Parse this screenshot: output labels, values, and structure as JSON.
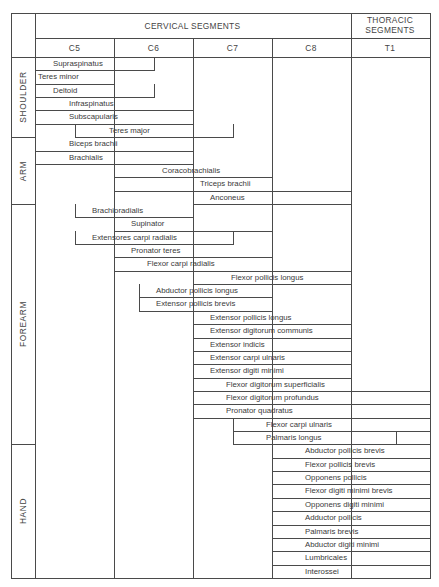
{
  "header": {
    "cervical_title": "CERVICAL SEGMENTS",
    "thoracic_title_line1": "THORACIC",
    "thoracic_title_line2": "SEGMENTS",
    "columns": [
      "C5",
      "C6",
      "C7",
      "C8",
      "T1"
    ]
  },
  "regions": [
    {
      "name": "SHOULDER",
      "start_row": 0,
      "rows": 6
    },
    {
      "name": "ARM",
      "start_row": 6,
      "rows": 5
    },
    {
      "name": "FOREARM",
      "start_row": 11,
      "rows": 18
    },
    {
      "name": "HAND",
      "start_row": 29,
      "rows": 10
    }
  ],
  "chart_data": {
    "type": "table",
    "segments": [
      "C5",
      "C6",
      "C7",
      "C8",
      "T1"
    ],
    "segment_groups": [
      {
        "label": "CERVICAL SEGMENTS",
        "segments": [
          "C5",
          "C6",
          "C7",
          "C8"
        ]
      },
      {
        "label": "THORACIC SEGMENTS",
        "segments": [
          "T1"
        ]
      }
    ],
    "note": "start/end expressed in segment units: 0 = start of C5, 1 = start of C6, 2 = start of C7, 3 = start of C8, 4 = start of T1, 5 = end of T1",
    "muscles": [
      {
        "region": "SHOULDER",
        "name": "Supraspinatus",
        "start": 0,
        "end": 1.5,
        "text_offset": 0.22
      },
      {
        "region": "SHOULDER",
        "name": "Teres minor",
        "start": 0,
        "end": 1,
        "text_offset": 0.03
      },
      {
        "region": "SHOULDER",
        "name": "Deltoid",
        "start": 0,
        "end": 1.5,
        "text_offset": 0.22
      },
      {
        "region": "SHOULDER",
        "name": "Infraspinatus",
        "start": 0,
        "end": 2,
        "text_offset": 0.42
      },
      {
        "region": "SHOULDER",
        "name": "Subscapularis",
        "start": 0,
        "end": 2,
        "text_offset": 0.42
      },
      {
        "region": "SHOULDER",
        "name": "Teres major",
        "start": 0.5,
        "end": 2.5,
        "text_offset": 0.42
      },
      {
        "region": "ARM",
        "name": "Biceps brachii",
        "start": 0,
        "end": 2,
        "text_offset": 0.42
      },
      {
        "region": "ARM",
        "name": "Brachialis",
        "start": 0,
        "end": 2,
        "text_offset": 0.42
      },
      {
        "region": "ARM",
        "name": "Coracobrachialis",
        "start": 1,
        "end": 3,
        "text_offset": 0.6
      },
      {
        "region": "ARM",
        "name": "Triceps brachii",
        "start": 1,
        "end": 4,
        "text_offset": 1.08
      },
      {
        "region": "ARM",
        "name": "Anconeus",
        "start": 2,
        "end": 4,
        "text_offset": 0.2
      },
      {
        "region": "FOREARM",
        "name": "Brachioradialis",
        "start": 0.5,
        "end": 2,
        "text_offset": 0.2
      },
      {
        "region": "FOREARM",
        "name": "Supinator",
        "start": 1,
        "end": 3,
        "text_offset": 0.2
      },
      {
        "region": "FOREARM",
        "name": "Extensores carpi radialis",
        "start": 0.5,
        "end": 2.5,
        "text_offset": 0.2
      },
      {
        "region": "FOREARM",
        "name": "Pronator teres",
        "start": 1,
        "end": 3,
        "text_offset": 0.2
      },
      {
        "region": "FOREARM",
        "name": "Flexor carpi radialis",
        "start": 1,
        "end": 4,
        "text_offset": 0.4
      },
      {
        "region": "FOREARM",
        "name": "Flexor pollicis longus",
        "start": 2,
        "end": 4,
        "text_offset": 0.47
      },
      {
        "region": "FOREARM",
        "name": "Abductor pollicis longus",
        "start": 1.32,
        "end": 3,
        "text_offset": 0.2
      },
      {
        "region": "FOREARM",
        "name": "Extensor pollicis brevis",
        "start": 1.32,
        "end": 3,
        "text_offset": 0.2
      },
      {
        "region": "FOREARM",
        "name": "Extensor pollicis longus",
        "start": 2,
        "end": 4,
        "text_offset": 0.2
      },
      {
        "region": "FOREARM",
        "name": "Extensor digitorum communis",
        "start": 2,
        "end": 4,
        "text_offset": 0.2
      },
      {
        "region": "FOREARM",
        "name": "Extensor indicis",
        "start": 2,
        "end": 4,
        "text_offset": 0.2
      },
      {
        "region": "FOREARM",
        "name": "Extensor carpi ulnaris",
        "start": 2,
        "end": 4,
        "text_offset": 0.2
      },
      {
        "region": "FOREARM",
        "name": "Extensor digiti minimi",
        "start": 2,
        "end": 4,
        "text_offset": 0.2
      },
      {
        "region": "FOREARM",
        "name": "Flexor digitorum superficialis",
        "start": 2,
        "end": 5,
        "text_offset": 0.4
      },
      {
        "region": "FOREARM",
        "name": "Flexor digitorum profundus",
        "start": 2,
        "end": 5,
        "text_offset": 0.4
      },
      {
        "region": "FOREARM",
        "name": "Pronator quadratus",
        "start": 2,
        "end": 5,
        "text_offset": 0.4
      },
      {
        "region": "FOREARM",
        "name": "Flexor carpi ulnaris",
        "start": 2.5,
        "end": 5,
        "text_offset": 0.4
      },
      {
        "region": "FOREARM",
        "name": "Palmaris longus",
        "start": 2.5,
        "end": 5,
        "text_offset": 0.4,
        "divider_at": 4.55
      },
      {
        "region": "HAND",
        "name": "Abductor pollicis brevis",
        "start": 3,
        "end": 5,
        "text_offset": 0.4
      },
      {
        "region": "HAND",
        "name": "Flexor pollicis brevis",
        "start": 3,
        "end": 5,
        "text_offset": 0.4
      },
      {
        "region": "HAND",
        "name": "Opponens pollicis",
        "start": 3,
        "end": 5,
        "text_offset": 0.4
      },
      {
        "region": "HAND",
        "name": "Flexor digiti minimi brevis",
        "start": 3,
        "end": 5,
        "text_offset": 0.4
      },
      {
        "region": "HAND",
        "name": "Opponens digiti minimi",
        "start": 3,
        "end": 5,
        "text_offset": 0.4
      },
      {
        "region": "HAND",
        "name": "Adductor pollicis",
        "start": 3,
        "end": 5,
        "text_offset": 0.4
      },
      {
        "region": "HAND",
        "name": "Palmaris brevis",
        "start": 3,
        "end": 5,
        "text_offset": 0.4
      },
      {
        "region": "HAND",
        "name": "Abductor digiti minimi",
        "start": 3,
        "end": 5,
        "text_offset": 0.4
      },
      {
        "region": "HAND",
        "name": "Lumbricales",
        "start": 3,
        "end": 5,
        "text_offset": 0.4
      },
      {
        "region": "HAND",
        "name": "Interossei",
        "start": 3,
        "end": 5,
        "text_offset": 0.4
      }
    ]
  }
}
